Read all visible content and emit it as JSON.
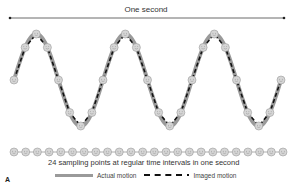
{
  "figure": {
    "panel_label": "A",
    "span_label": "One second",
    "caption": "24 sampling points at regular time intervals in one second",
    "legend": {
      "actual": "Actual motion",
      "imaged": "Imaged motion"
    },
    "colors": {
      "actual_line": "#9a9a9a",
      "imaged_line": "#111111",
      "sample_point_fill": "#d6d6d6",
      "sample_point_stroke": "#9a9a9a",
      "text": "#333333"
    },
    "wave": {
      "cycles": 3,
      "points_per_cycle": 8,
      "x_start": 14,
      "x_end": 281,
      "y_center": 80,
      "amplitude": 46
    },
    "sample_row": {
      "count": 24,
      "x_start": 14,
      "x_end": 283,
      "y": 152
    },
    "span_line": {
      "x1": 10,
      "x2": 284,
      "y": 18
    }
  }
}
